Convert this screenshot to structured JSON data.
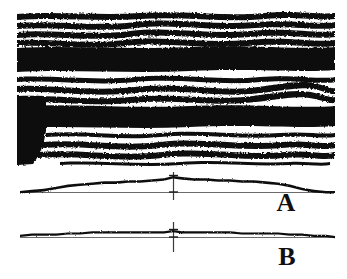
{
  "figure": {
    "title_present": false,
    "background_color": "#ffffff",
    "ink_color": "#0d0d0d",
    "width_px": 347,
    "height_px": 279,
    "panels": [
      {
        "id": "seismic-section",
        "kind": "variable-area-wiggle-section",
        "x": 17,
        "y": 10,
        "w": 318,
        "h": 157
      },
      {
        "id": "trace-a",
        "kind": "single-trace",
        "label": "A",
        "x": 20,
        "y": 168,
        "w": 315,
        "h": 35,
        "baseline_y": 192,
        "marker_x": 173
      },
      {
        "id": "trace-b",
        "kind": "single-trace",
        "label": "B",
        "x": 20,
        "y": 220,
        "w": 315,
        "h": 32,
        "baseline_y": 236,
        "marker_x": 173
      }
    ]
  },
  "labels": {
    "panel_a": "A",
    "panel_b": "B"
  },
  "chart_data": {
    "type": "line",
    "title": "",
    "subtitle": "",
    "xlabel": "",
    "ylabel": "",
    "grid": false,
    "legend": "none",
    "annotations": [
      {
        "text": "A",
        "x": 286,
        "y": 203,
        "role": "panel-label"
      },
      {
        "text": "B",
        "x": 287,
        "y": 256,
        "role": "panel-label"
      }
    ],
    "markers": [
      {
        "name": "crosshair-a",
        "x": 173,
        "y_top": 172,
        "y_bottom": 200
      },
      {
        "name": "crosshair-b",
        "x": 173,
        "y_top": 222,
        "y_bottom": 252
      }
    ],
    "series": [
      {
        "name": "trace-a",
        "panel": "trace-a",
        "description": "broad low-amplitude bell-shaped envelope above a straight baseline",
        "x": [
          20,
          32,
          44,
          56,
          68,
          80,
          92,
          104,
          116,
          128,
          140,
          152,
          164,
          173,
          182,
          194,
          206,
          218,
          230,
          242,
          254,
          266,
          278,
          290,
          302,
          314,
          326,
          335
        ],
        "values": [
          1,
          2,
          3,
          5,
          7,
          8,
          9,
          10,
          10,
          11,
          11,
          12,
          13,
          15,
          14,
          13,
          13,
          12,
          12,
          11,
          11,
          10,
          9,
          7,
          4,
          2,
          1,
          1
        ]
      },
      {
        "name": "trace-b",
        "panel": "trace-b",
        "description": "near-flat low-amplitude trace along the baseline",
        "x": [
          20,
          32,
          44,
          56,
          68,
          80,
          92,
          104,
          116,
          128,
          140,
          152,
          164,
          173,
          182,
          194,
          206,
          218,
          230,
          242,
          254,
          266,
          278,
          290,
          302,
          314,
          326,
          335
        ],
        "values": [
          1,
          2,
          2,
          2,
          3,
          3,
          4,
          4,
          4,
          4,
          4,
          4,
          4,
          5,
          4,
          4,
          4,
          4,
          4,
          3,
          3,
          3,
          3,
          2,
          2,
          1,
          1,
          0
        ]
      }
    ],
    "section_events": [
      {
        "name": "reflector-1",
        "y": 15,
        "thickness": 5,
        "fill": "wiggle"
      },
      {
        "name": "reflector-2",
        "y": 23,
        "thickness": 5,
        "fill": "wiggle"
      },
      {
        "name": "reflector-3",
        "y": 31,
        "thickness": 5,
        "fill": "wiggle"
      },
      {
        "name": "reflector-4",
        "y": 40,
        "thickness": 5,
        "fill": "wiggle"
      },
      {
        "name": "strong-band-1",
        "y": 48,
        "thickness": 22,
        "fill": "solid"
      },
      {
        "name": "reflector-5",
        "y": 77,
        "thickness": 5,
        "fill": "wiggle"
      },
      {
        "name": "reflector-6",
        "y": 86,
        "thickness": 6,
        "fill": "wiggle"
      },
      {
        "name": "reflector-7",
        "y": 96,
        "thickness": 6,
        "fill": "wiggle"
      },
      {
        "name": "strong-band-2",
        "y": 106,
        "thickness": 20,
        "fill": "solid"
      },
      {
        "name": "reflector-8",
        "y": 132,
        "thickness": 4,
        "fill": "wiggle"
      },
      {
        "name": "reflector-9",
        "y": 141,
        "thickness": 5,
        "fill": "wiggle"
      },
      {
        "name": "reflector-10",
        "y": 151,
        "thickness": 5,
        "fill": "wiggle"
      },
      {
        "name": "reflector-11",
        "y": 161,
        "thickness": 3,
        "fill": "wiggle"
      },
      {
        "name": "left-blanked-block",
        "x": 17,
        "y": 100,
        "w": 28,
        "h": 65,
        "fill": "solid"
      }
    ]
  }
}
